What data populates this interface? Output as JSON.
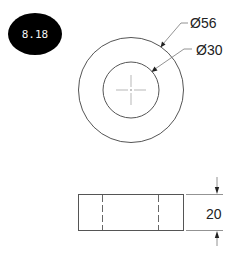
{
  "badge": {
    "label": "8.18",
    "background": "#000000",
    "text_color": "#f2f2f2"
  },
  "top_view": {
    "outer_diameter_label": "Ø56",
    "inner_diameter_label": "Ø30"
  },
  "front_view": {
    "height_label": "20"
  },
  "colors": {
    "line": "#555555",
    "text": "#222222",
    "background": "#ffffff"
  }
}
